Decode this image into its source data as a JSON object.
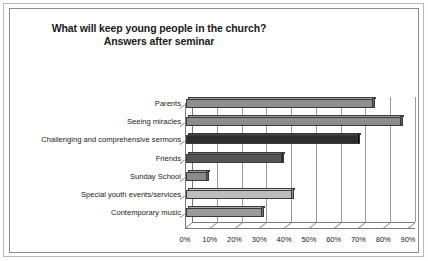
{
  "title": {
    "line1": "What will keep young people in the church?",
    "line2": "Answers after seminar"
  },
  "chart_data": {
    "type": "bar",
    "orientation": "horizontal",
    "title": "What will keep young people in the church? Answers after seminar",
    "xlabel": "",
    "ylabel": "",
    "xlim": [
      0,
      90
    ],
    "grid": true,
    "legend": "none",
    "tick_labels": [
      "0%",
      "10%",
      "20%",
      "30%",
      "40%",
      "50%",
      "60%",
      "70%",
      "80%",
      "90%"
    ],
    "tick_values": [
      0,
      10,
      20,
      30,
      40,
      50,
      60,
      70,
      80,
      90
    ],
    "categories": [
      "Parents",
      "Seeing miracles",
      "Challenging and comprehensive sermons",
      "Friends",
      "Sunday School",
      "Special youth events/services",
      "Contemporary music"
    ],
    "values": [
      76,
      87,
      70,
      39,
      9,
      43,
      31
    ],
    "bar_colors": [
      "#8f8f8f",
      "#8c8c8c",
      "#2e2e2e",
      "#555555",
      "#8a8a8a",
      "#bdbdbd",
      "#9a9a9a"
    ]
  },
  "colors": {
    "frame": "#8c8c8c",
    "page_edge": "#b9b9b9",
    "gridline": "#9a9a9a",
    "text": "#222222",
    "background": "#ffffff"
  }
}
